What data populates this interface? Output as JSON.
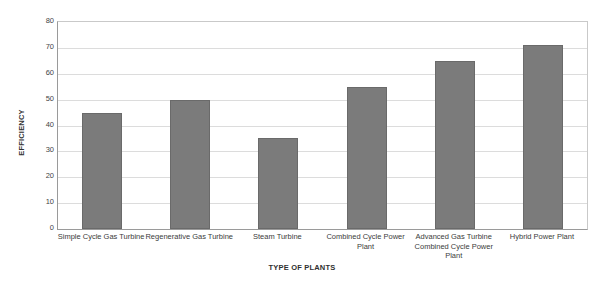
{
  "chart_data": {
    "type": "bar",
    "title": "",
    "xlabel": "TYPE OF PLANTS",
    "ylabel": "EFFICIENCY",
    "categories": [
      "Simple Cycle Gas Turbine",
      "Regenerative Gas Turbine",
      "Steam Turbine",
      "Combined Cycle Power Plant",
      "Advanced Gas Turbine Combined Cycle Power Plant",
      "Hybrid Power Plant"
    ],
    "values": [
      45,
      50,
      35,
      55,
      65,
      71
    ],
    "ylim": [
      0,
      80
    ],
    "ytick_labels": [
      "80",
      "70",
      "60",
      "50",
      "40",
      "30",
      "20",
      "10",
      "0"
    ],
    "ytick_values": [
      80,
      70,
      60,
      50,
      40,
      30,
      20,
      10,
      0
    ],
    "grid": true,
    "legend": "none",
    "bar_color": "#7b7b7b",
    "bar_border_color": "#6a6a6a",
    "gridline_color": "#dcdcdc",
    "axis_color": "#9a9a9a",
    "background_color": "#ffffff"
  }
}
